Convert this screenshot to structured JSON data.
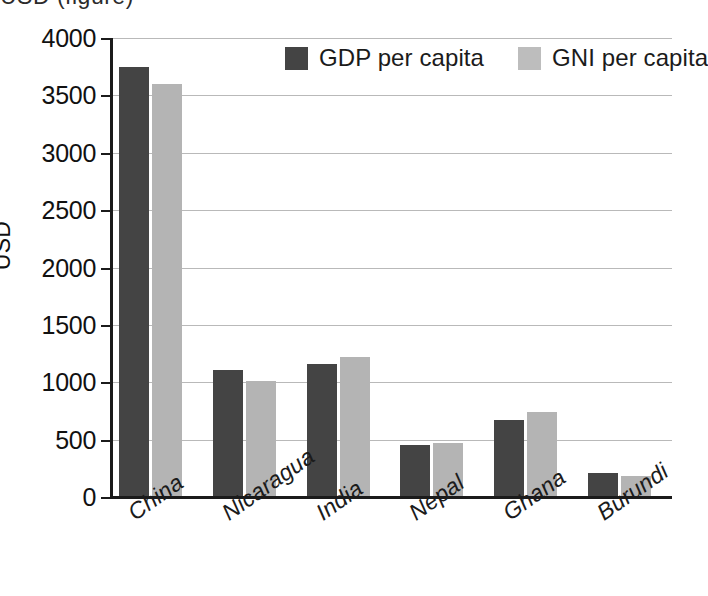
{
  "top_caption": "USD (figure)",
  "chart_data": {
    "type": "bar",
    "title": "",
    "xlabel": "",
    "ylabel": "USD",
    "ylim": [
      0,
      4000
    ],
    "ytick_values": [
      0,
      500,
      1000,
      1500,
      2000,
      2500,
      3000,
      3500,
      4000
    ],
    "ytick_labels": [
      "0",
      "500",
      "1000",
      "1500",
      "2000",
      "2500",
      "3000",
      "3500",
      "4000"
    ],
    "grid": true,
    "legend_position": "top-center",
    "categories": [
      "China",
      "Nicaragua",
      "India",
      "Nepal",
      "Ghana",
      "Burundi"
    ],
    "series": [
      {
        "name": "GDP per capita",
        "color": "#444444",
        "values": [
          3750,
          1110,
          1160,
          450,
          670,
          210
        ]
      },
      {
        "name": "GNI per capita",
        "color": "#b4b4b4",
        "values": [
          3600,
          1010,
          1220,
          470,
          740,
          180
        ]
      }
    ]
  }
}
